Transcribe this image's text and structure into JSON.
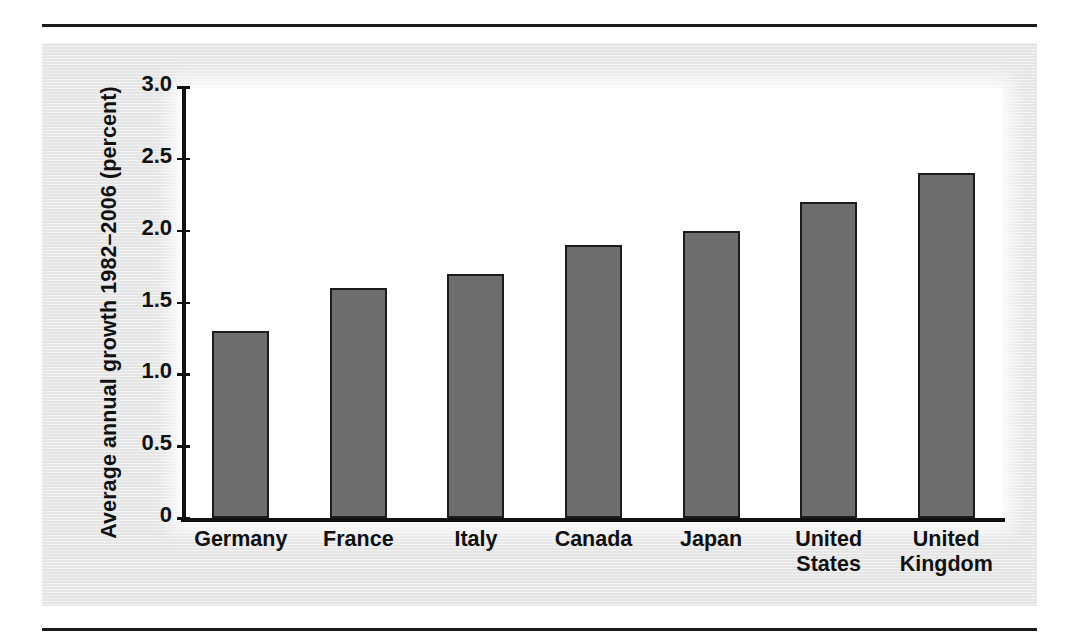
{
  "chart_data": {
    "type": "bar",
    "title": "",
    "subtitle": "",
    "xlabel": "",
    "ylabel": "Average annual growth 1982–2006 (percent)",
    "categories": [
      "Germany",
      "France",
      "Italy",
      "Canada",
      "Japan",
      "United States",
      "United Kingdom"
    ],
    "category_lines": [
      [
        "Germany"
      ],
      [
        "France"
      ],
      [
        "Italy"
      ],
      [
        "Canada"
      ],
      [
        "Japan"
      ],
      [
        "United",
        "States"
      ],
      [
        "United",
        "Kingdom"
      ]
    ],
    "values": [
      1.3,
      1.6,
      1.7,
      1.9,
      2.0,
      2.2,
      2.4
    ],
    "ylim": [
      0,
      3.0
    ],
    "ytick_values": [
      0,
      0.5,
      1.0,
      1.5,
      2.0,
      2.5,
      3.0
    ],
    "ytick_labels": [
      "0",
      "0.5",
      "1.0",
      "1.5",
      "2.0",
      "2.5",
      "3.0"
    ],
    "grid": false,
    "legend": "none",
    "bar_color": "#6e6e6e",
    "bar_border_color": "#1c1c1c",
    "panel_background": "#e8e8e8",
    "plot_background": "#ffffff",
    "axis_color": "#111111",
    "text_color": "#111111"
  }
}
